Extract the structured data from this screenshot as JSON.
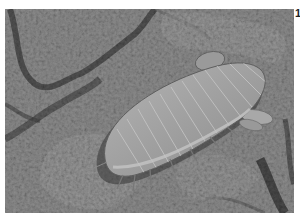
{
  "figure": {
    "number": "1",
    "tone": "grayscale"
  },
  "colors": {
    "rock_base": "#8a8a8a",
    "rock_dark": "#4a4a4a",
    "rock_light": "#a8a8a8",
    "body_base": "#9c9c9c",
    "body_highlight": "#b8b8b8",
    "body_shadow": "#5a5a5a"
  }
}
